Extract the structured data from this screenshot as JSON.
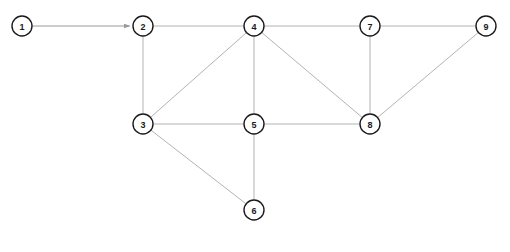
{
  "diagram": {
    "type": "node-link-graph",
    "background_color": "#ffffff",
    "node_fill_color": "#ffffff",
    "node_stroke_color": "#1a1a1a",
    "edge_color": "#b3b3b3",
    "arrow_color": "#9a9a9a",
    "node_radius": 10,
    "nodes": [
      {
        "id": "1",
        "label": "1",
        "x": 22,
        "y": 26
      },
      {
        "id": "2",
        "label": "2",
        "x": 143,
        "y": 26
      },
      {
        "id": "3",
        "label": "3",
        "x": 143,
        "y": 124
      },
      {
        "id": "4",
        "label": "4",
        "x": 254,
        "y": 26
      },
      {
        "id": "5",
        "label": "5",
        "x": 254,
        "y": 124
      },
      {
        "id": "6",
        "label": "6",
        "x": 254,
        "y": 210
      },
      {
        "id": "7",
        "label": "7",
        "x": 370,
        "y": 26
      },
      {
        "id": "8",
        "label": "8",
        "x": 370,
        "y": 124
      },
      {
        "id": "9",
        "label": "9",
        "x": 486,
        "y": 26
      }
    ],
    "edges": [
      {
        "from": "1",
        "to": "2",
        "directed": true
      },
      {
        "from": "2",
        "to": "4",
        "directed": false
      },
      {
        "from": "2",
        "to": "3",
        "directed": false
      },
      {
        "from": "3",
        "to": "4",
        "directed": false
      },
      {
        "from": "3",
        "to": "5",
        "directed": false
      },
      {
        "from": "3",
        "to": "6",
        "directed": false
      },
      {
        "from": "4",
        "to": "5",
        "directed": false
      },
      {
        "from": "4",
        "to": "7",
        "directed": false
      },
      {
        "from": "4",
        "to": "8",
        "directed": false
      },
      {
        "from": "5",
        "to": "6",
        "directed": false
      },
      {
        "from": "5",
        "to": "8",
        "directed": false
      },
      {
        "from": "7",
        "to": "8",
        "directed": false
      },
      {
        "from": "7",
        "to": "9",
        "directed": false
      },
      {
        "from": "8",
        "to": "9",
        "directed": false
      }
    ]
  }
}
